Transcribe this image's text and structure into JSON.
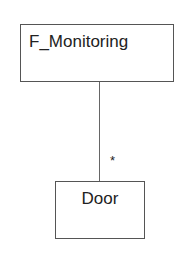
{
  "diagram": {
    "type": "uml-association",
    "classes": [
      {
        "name": "F_Monitoring"
      },
      {
        "name": "Door"
      }
    ],
    "association": {
      "from": "F_Monitoring",
      "to": "Door",
      "multiplicity_to": "*"
    }
  }
}
